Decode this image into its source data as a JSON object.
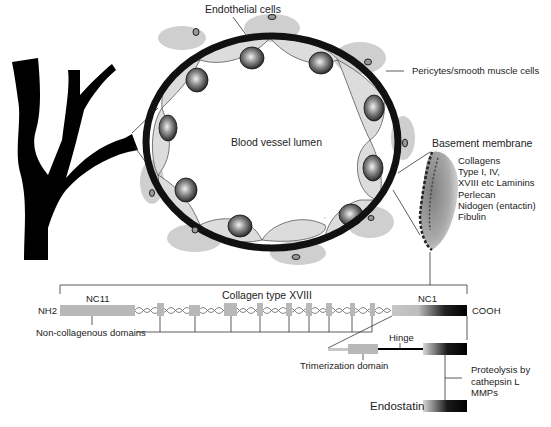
{
  "figure": {
    "labels": {
      "endothelial_cells": "Endothelial cells",
      "pericytes": "Pericytes/smooth muscle cells",
      "lumen": "Blood vessel lumen",
      "basement_membrane": "Basement membrane"
    },
    "basement_membrane_components": [
      "Collagens",
      "Type I, IV,",
      "XVIII etc Laminins",
      "Perlecan",
      "Nidogen (entactin)",
      "Fibulin"
    ],
    "collagen": {
      "title": "Collagen type XVIII",
      "n_terminus": "NH2",
      "c_terminus": "COOH",
      "nc11": "NC11",
      "nc1": "NC1",
      "non_collagenous": "Non-collagenous domains",
      "hinge": "Hinge",
      "trimerization": "Trimerization domain",
      "proteolysis": [
        "Proteolysis by",
        "cathepsin L",
        "MMPs"
      ],
      "product": "Endostatin"
    },
    "colors": {
      "vessel_wall": "#111111",
      "cell_fill": "#d9d9d9",
      "pericyte_halo": "#cfcfcf",
      "domain_box": "#b8b8b8",
      "line": "#333333"
    }
  }
}
